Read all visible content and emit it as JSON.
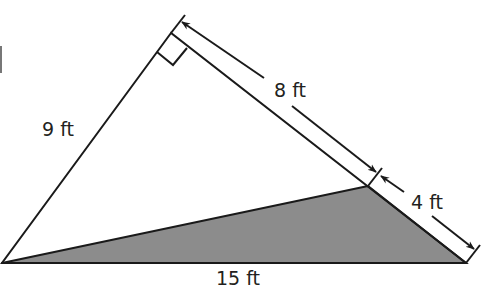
{
  "diagram": {
    "type": "triangle-with-shaded-region",
    "colors": {
      "stroke": "#1a1a1a",
      "shaded_fill": "#8c8c8c",
      "background": "#ffffff",
      "text": "#231f20"
    },
    "vertices": {
      "top": [
        171,
        33
      ],
      "bottom_left": [
        2,
        263
      ],
      "bottom_right": [
        466,
        263
      ],
      "split_point": [
        368,
        186
      ]
    },
    "labels": {
      "left_side": "9 ft",
      "upper_right_segment": "8 ft",
      "lower_right_segment": "4 ft",
      "base": "15 ft"
    },
    "right_angle_marker": true,
    "shaded_region": "triangle formed by bottom-left vertex, split point, and bottom-right vertex"
  }
}
